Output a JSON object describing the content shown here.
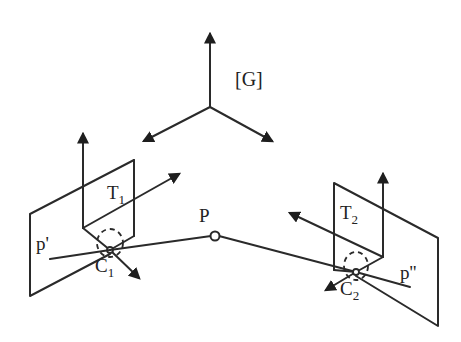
{
  "diagram": {
    "type": "stereo-camera-geometry",
    "global_frame": {
      "label": "[G]"
    },
    "point": {
      "label": "P"
    },
    "camera1": {
      "label": "C",
      "sub": "1",
      "image_point": "p'",
      "transform": "T",
      "transform_sub": "1"
    },
    "camera2": {
      "label": "C",
      "sub": "2",
      "image_point": "p''",
      "transform": "T",
      "transform_sub": "2"
    }
  },
  "colors": {
    "ink": "#2a2a2a",
    "background": "#ffffff"
  }
}
